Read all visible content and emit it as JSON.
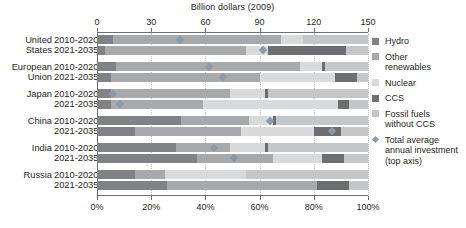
{
  "chart_data": {
    "type": "bar",
    "orientation": "horizontal",
    "stacked": true,
    "title": "Billion dollars (2009)",
    "top_axis": {
      "label": "Billion dollars (2009)",
      "ticks": [
        0,
        30,
        60,
        90,
        120,
        150
      ],
      "tick_labels": [
        "0",
        "30",
        "60",
        "90",
        "120",
        "150"
      ],
      "range": [
        0,
        150
      ]
    },
    "bottom_axis": {
      "label": "",
      "ticks": [
        0,
        20,
        40,
        60,
        80,
        100
      ],
      "tick_labels": [
        "0%",
        "20%",
        "40%",
        "60%",
        "80%",
        "100%"
      ],
      "range": [
        0,
        100
      ]
    },
    "grid": "dotted-vertical",
    "legend_position": "right",
    "series": [
      {
        "name": "Hydro",
        "color": "#808285"
      },
      {
        "name": "Other renewables",
        "color": "#a7a9ac"
      },
      {
        "name": "Nuclear",
        "color": "#d9dadb"
      },
      {
        "name": "CCS",
        "color": "#6d6e71"
      },
      {
        "name": "Fossil fuels without CCS",
        "color": "#c4c6c8"
      }
    ],
    "marker": {
      "name": "Total average annual investment (top axis)",
      "color": "#8d9aa5",
      "shape": "diamond"
    },
    "groups": [
      {
        "country": "United\nStates",
        "rows": [
          {
            "period": "2010-2020",
            "shares": {
              "hydro": 6,
              "other_renewables": 62,
              "nuclear": 8,
              "ccs": 0,
              "fossil": 24
            },
            "total_investment": 46
          },
          {
            "period": "2021-2035",
            "shares": {
              "hydro": 3,
              "other_renewables": 52,
              "nuclear": 8,
              "ccs": 29,
              "fossil": 8
            },
            "total_investment": 92
          }
        ]
      },
      {
        "country": "European\nUnion",
        "rows": [
          {
            "period": "2010-2020",
            "shares": {
              "hydro": 7,
              "other_renewables": 68,
              "nuclear": 8,
              "ccs": 1,
              "fossil": 16
            },
            "total_investment": 62
          },
          {
            "period": "2021-2035",
            "shares": {
              "hydro": 5,
              "other_renewables": 55,
              "nuclear": 28,
              "ccs": 8,
              "fossil": 4
            },
            "total_investment": 70
          }
        ]
      },
      {
        "country": "Japan",
        "rows": [
          {
            "period": "2010-2020",
            "shares": {
              "hydro": 5,
              "other_renewables": 44,
              "nuclear": 13,
              "ccs": 1,
              "fossil": 37
            },
            "total_investment": 9
          },
          {
            "period": "2021-2035",
            "shares": {
              "hydro": 5,
              "other_renewables": 34,
              "nuclear": 50,
              "ccs": 4,
              "fossil": 7
            },
            "total_investment": 13
          }
        ]
      },
      {
        "country": "China",
        "rows": [
          {
            "period": "2010-2020",
            "shares": {
              "hydro": 31,
              "other_renewables": 25,
              "nuclear": 9,
              "ccs": 1,
              "fossil": 34
            },
            "total_investment": 96
          },
          {
            "period": "2021-2035",
            "shares": {
              "hydro": 14,
              "other_renewables": 39,
              "nuclear": 27,
              "ccs": 10,
              "fossil": 10
            },
            "total_investment": 130
          }
        ]
      },
      {
        "country": "India",
        "rows": [
          {
            "period": "2010-2020",
            "shares": {
              "hydro": 29,
              "other_renewables": 20,
              "nuclear": 13,
              "ccs": 1,
              "fossil": 37
            },
            "total_investment": 65
          },
          {
            "period": "2021-2035",
            "shares": {
              "hydro": 37,
              "other_renewables": 28,
              "nuclear": 18,
              "ccs": 8,
              "fossil": 9
            },
            "total_investment": 76
          }
        ]
      },
      {
        "country": "Russia",
        "rows": [
          {
            "period": "2010-2020",
            "shares": {
              "hydro": 14,
              "other_renewables": 11,
              "nuclear": 30,
              "ccs": 0,
              "fossil": 45
            },
            "total_investment": null
          },
          {
            "period": "2021-2035",
            "shares": {
              "hydro": 26,
              "other_renewables": 55,
              "nuclear": 0,
              "ccs": 12,
              "fossil": 7
            },
            "total_investment": null
          }
        ]
      }
    ]
  },
  "legend": {
    "items": [
      {
        "label": "Hydro",
        "type": "swatch",
        "color": "#808285"
      },
      {
        "label": "Other\nrenewables",
        "type": "swatch",
        "color": "#a7a9ac"
      },
      {
        "label": "Nuclear",
        "type": "swatch",
        "color": "#d9dadb"
      },
      {
        "label": "CCS",
        "type": "swatch",
        "color": "#6d6e71"
      },
      {
        "label": "Fossil fuels\nwithout CCS",
        "type": "swatch",
        "color": "#c4c6c8"
      },
      {
        "label": "Total average\nannual investment\n(top axis)",
        "type": "diamond",
        "color": "#8d9aa5"
      }
    ]
  }
}
